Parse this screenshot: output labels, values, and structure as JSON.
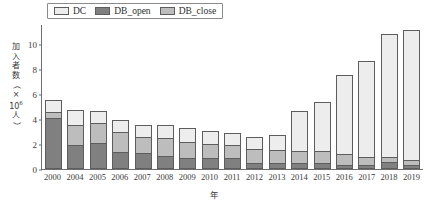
{
  "chart_data": {
    "type": "bar",
    "stacked": true,
    "title": "",
    "xlabel": "年",
    "ylabel": "加入者数（×10⁶人）",
    "ylabel_parts": [
      "加",
      "入",
      "者",
      "数",
      "（",
      "×",
      "10",
      "人",
      "）"
    ],
    "ylim": [
      0,
      11.6
    ],
    "yticks": [
      0,
      2,
      4,
      6,
      8,
      10
    ],
    "ytick_labels": [
      "0",
      "2",
      "4",
      "6",
      "8",
      "10"
    ],
    "grid": false,
    "legend_position": "top-left",
    "categories": [
      "2000",
      "2004",
      "2005",
      "2006",
      "2007",
      "2008",
      "2009",
      "2010",
      "2011",
      "2012",
      "2013",
      "2014",
      "2015",
      "2016",
      "2017",
      "2018",
      "2019"
    ],
    "series": [
      {
        "name": "DB_open",
        "color": "#808080",
        "values": [
          4.1,
          1.9,
          2.1,
          1.4,
          1.25,
          1.05,
          0.9,
          0.9,
          0.85,
          0.5,
          0.45,
          0.45,
          0.45,
          0.35,
          0.35,
          0.55,
          0.3
        ]
      },
      {
        "name": "DB_close",
        "color": "#bdbdbd",
        "values": [
          0.45,
          1.65,
          1.55,
          1.6,
          1.35,
          1.45,
          1.3,
          1.1,
          1.05,
          1.1,
          1.05,
          1.0,
          1.0,
          0.85,
          0.65,
          0.45,
          0.45
        ]
      },
      {
        "name": "DC",
        "color": "#ededed",
        "values": [
          0.95,
          1.2,
          1.0,
          0.95,
          0.9,
          1.0,
          1.05,
          1.05,
          0.95,
          1.0,
          1.2,
          3.2,
          3.9,
          6.35,
          7.65,
          9.8,
          10.4
        ]
      }
    ],
    "totals": [
      5.5,
      4.75,
      4.65,
      3.95,
      3.5,
      3.5,
      3.25,
      3.05,
      2.85,
      2.6,
      2.7,
      4.65,
      5.35,
      7.55,
      8.65,
      10.8,
      11.15
    ]
  },
  "legend": {
    "items": [
      {
        "label": "DC",
        "color": "#ededed"
      },
      {
        "label": "DB_open",
        "color": "#808080"
      },
      {
        "label": "DB_close",
        "color": "#bdbdbd"
      }
    ]
  },
  "colors": {
    "dc": "#ededed",
    "db_open": "#808080",
    "db_close": "#bdbdbd",
    "axis": "#6f6f6f",
    "text": "#3a3a3a",
    "background": "#ffffff"
  }
}
